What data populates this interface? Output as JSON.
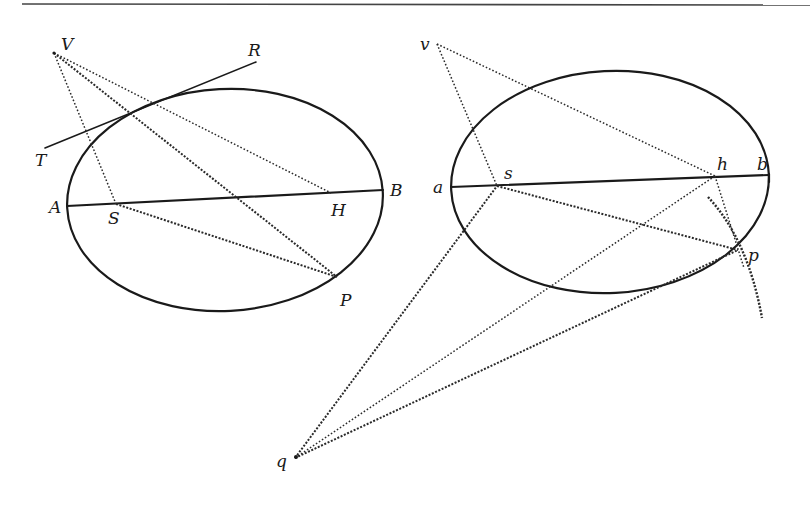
{
  "figure": {
    "left": {
      "labels": {
        "V": "V",
        "R": "R",
        "T": "T",
        "A": "A",
        "S": "S",
        "H": "H",
        "B": "B",
        "P": "P"
      },
      "points": {
        "V": [
          54,
          53
        ],
        "R": [
          256,
          62
        ],
        "T": [
          45,
          148
        ],
        "A": [
          67,
          206
        ],
        "S": [
          116,
          204
        ],
        "H": [
          331,
          193
        ],
        "B": [
          383,
          190
        ],
        "P": [
          337,
          277
        ]
      },
      "ellipse": {
        "cx": 225,
        "cy": 200,
        "rx": 158,
        "ry": 111,
        "rotate": -3
      }
    },
    "right": {
      "labels": {
        "v": "v",
        "a": "a",
        "s": "s",
        "h": "h",
        "b": "b",
        "p": "p",
        "q": "q"
      },
      "points": {
        "v": [
          437,
          44
        ],
        "a": [
          451,
          187
        ],
        "s": [
          497,
          186
        ],
        "h": [
          715,
          176
        ],
        "b": [
          769,
          175
        ],
        "p": [
          738,
          250
        ],
        "q": [
          295,
          458
        ]
      },
      "ellipse": {
        "cx": 610,
        "cy": 182,
        "rx": 159,
        "ry": 111,
        "rotate": -3
      }
    },
    "colors": {
      "ink": "#1a1a1a",
      "paper": "#ffffff"
    }
  }
}
